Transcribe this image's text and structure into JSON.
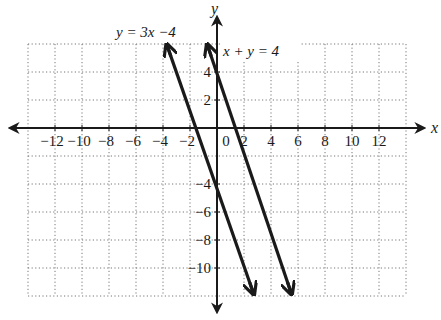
{
  "chart_data": {
    "type": "line",
    "title": "",
    "xlabel": "x",
    "ylabel": "y",
    "xlim": [
      -14,
      14
    ],
    "ylim": [
      -12,
      6
    ],
    "grid": true,
    "grid_style": "dotted",
    "grid_step": 2,
    "x_ticks": [
      -12,
      -10,
      -8,
      -6,
      -4,
      -2,
      0,
      2,
      4,
      6,
      8,
      10,
      12
    ],
    "x_tick_labels": [
      "−12",
      "−10",
      "−8",
      "−6",
      "−4",
      "−2",
      "0",
      "2",
      "4",
      "6",
      "8",
      "10",
      "12"
    ],
    "y_ticks": [
      4,
      2,
      -4,
      -6,
      -8,
      -10
    ],
    "y_tick_labels": [
      "4",
      "2",
      "−4",
      "−6",
      "−8",
      "−10"
    ],
    "series": [
      {
        "name": "y = 3x −4",
        "label": "y = 3x −4",
        "points": [
          [
            -3.7,
            5.9
          ],
          [
            2.7,
            -11.8
          ]
        ],
        "arrows": "both"
      },
      {
        "name": "x + y = 4",
        "label": "x + y = 4",
        "points": [
          [
            -0.7,
            5.9
          ],
          [
            5.5,
            -11.8
          ]
        ],
        "arrows": "both"
      }
    ]
  },
  "axes": {
    "x_name": "x",
    "y_name": "y",
    "origin_label": "0"
  },
  "labels": {
    "eq1": "y = 3x −4",
    "eq2": "x + y = 4"
  },
  "colors": {
    "ink": "#1a1a1a",
    "grid": "#777777",
    "background": "#ffffff"
  }
}
